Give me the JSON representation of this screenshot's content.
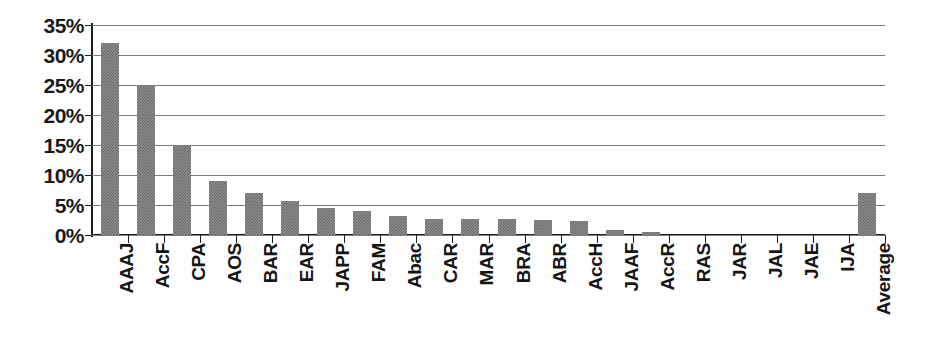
{
  "chart_data": {
    "type": "bar",
    "title": "",
    "subtitle": "",
    "xlabel": "",
    "ylabel": "",
    "ylim": [
      0,
      35
    ],
    "ytick_labels": [
      "0%",
      "5%",
      "10%",
      "15%",
      "20%",
      "25%",
      "30%",
      "35%"
    ],
    "ytick_values": [
      0,
      5,
      10,
      15,
      20,
      25,
      30,
      35
    ],
    "grid": true,
    "legend": false,
    "legend_position": "none",
    "value_unit": "percent",
    "categories": [
      "AAAJ",
      "AccF",
      "CPA",
      "AOS",
      "BAR",
      "EAR",
      "JAPP",
      "FAM",
      "Abac",
      "CAR",
      "MAR",
      "BRA",
      "ABR",
      "AccH",
      "JAAF",
      "AccR",
      "RAS",
      "JAR",
      "JAL",
      "JAE",
      "IJA",
      "Average"
    ],
    "values": [
      32.0,
      25.0,
      15.0,
      9.0,
      7.0,
      5.7,
      4.5,
      4.0,
      3.1,
      2.7,
      2.6,
      2.6,
      2.5,
      2.3,
      0.9,
      0.5,
      0.0,
      0.0,
      0.0,
      0.0,
      0.0,
      7.0
    ],
    "colors": {
      "bar_fill": "#8e8e8e",
      "bar_pattern": "#666666",
      "gridline": "#7d7d7d",
      "axis": "#1d1d1d",
      "text": "#151515",
      "background": "#ffffff"
    }
  }
}
